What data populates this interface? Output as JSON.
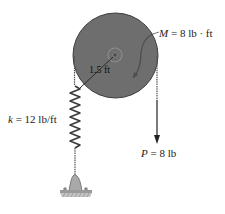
{
  "diagram": {
    "type": "mechanics-free-body",
    "disk": {
      "radius_label": "1.5 ft",
      "fill_color": "#6e6e6e",
      "edge_color": "#3a3a3a"
    },
    "moment": {
      "symbol": "M",
      "equals": " = ",
      "value": "8 lb · ft"
    },
    "spring": {
      "symbol": "k",
      "equals": " = ",
      "value": "12 lb/ft"
    },
    "force": {
      "symbol": "P",
      "equals": " = ",
      "value": "8 lb"
    },
    "colors": {
      "background": "#ffffff",
      "ink": "#222222",
      "disk": "#6e6e6e",
      "ground": "#9a9a9a"
    }
  }
}
